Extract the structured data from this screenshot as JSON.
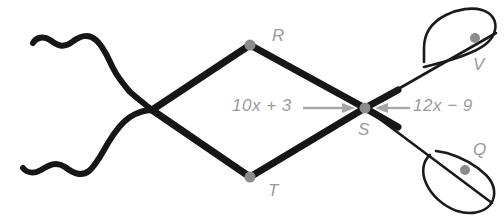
{
  "figure": {
    "background_color": "#ffffff",
    "stroke_color": "#161616",
    "thin_stroke_color": "#1a1a1a",
    "vertex_dot_color": "#8c8c8c",
    "label_color": "#9a9a9a",
    "arrow_color": "#a6a6a6"
  },
  "vertices": {
    "R": {
      "label": "R",
      "x": 250,
      "y": 45,
      "label_x": 272,
      "label_y": 26
    },
    "T": {
      "label": "T",
      "x": 250,
      "y": 177,
      "label_x": 268,
      "label_y": 181
    },
    "S": {
      "label": "S",
      "x": 365,
      "y": 108,
      "label_x": 358,
      "label_y": 120
    },
    "V": {
      "label": "V",
      "x": 475,
      "y": 38,
      "label_x": 473,
      "label_y": 55
    },
    "Q": {
      "label": "Q",
      "x": 465,
      "y": 170,
      "label_x": 473,
      "label_y": 140
    }
  },
  "measures": {
    "left": {
      "text": "10x + 3",
      "coefficient": "10",
      "variable": "x",
      "operator": "+",
      "constant": "3",
      "label_x": 232,
      "label_y": 96,
      "arrow_from_x": 303,
      "arrow_to_x": 352,
      "arrow_y": 108,
      "direction": "right"
    },
    "right": {
      "text": "12x − 9",
      "coefficient": "12",
      "variable": "x",
      "operator": "−",
      "constant": "9",
      "label_x": 413,
      "label_y": 96,
      "arrow_from_x": 408,
      "arrow_to_x": 378,
      "arrow_y": 108,
      "direction": "left"
    }
  },
  "shapes": {
    "left_crossing_x": 152,
    "left_crossing_y": 110,
    "squiggle_top_label": "wavy-line-upper-left",
    "squiggle_bottom_label": "wavy-line-lower-left",
    "loop_top_label": "loop-upper-right",
    "loop_bottom_label": "loop-lower-right"
  }
}
